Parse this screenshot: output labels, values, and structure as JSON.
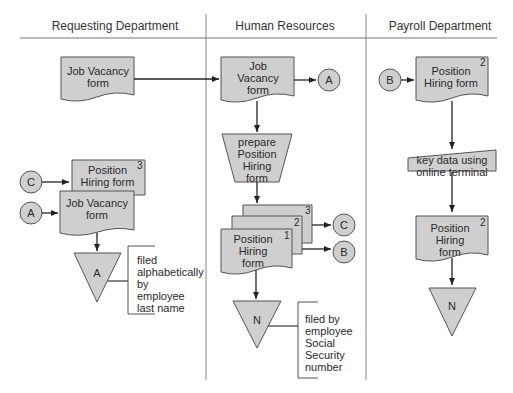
{
  "colors": {
    "fill": "#cfcfcf",
    "stroke": "#555555",
    "line": "#222222"
  },
  "lanes": [
    {
      "title": "Requesting Department"
    },
    {
      "title": "Human Resources"
    },
    {
      "title": "Payroll Department"
    }
  ],
  "requesting": {
    "job_vacancy_doc": "Job Vacancy form",
    "connector_c": "C",
    "connector_a": "A",
    "position_hiring_doc": "Position Hiring form",
    "position_hiring_copy": "3",
    "job_vacancy_doc2": "Job Vacancy form",
    "file_label": "A",
    "file_note": "filed alphabetically by employee last name"
  },
  "hr": {
    "job_vacancy_doc": "Job Vacancy form",
    "connector_a": "A",
    "manual_op": "prepare Position Hiring form",
    "copy3": "3",
    "copy2": "2",
    "copy1": "1",
    "position_hiring_doc": "Position Hiring form",
    "connector_c": "C",
    "connector_b": "B",
    "file_label": "N",
    "file_note": "filed by employee Social Security number"
  },
  "payroll": {
    "connector_b": "B",
    "position_hiring_doc": "Position Hiring form",
    "position_hiring_copy": "2",
    "manual_input": "key data using online terminal",
    "position_hiring_doc2": "Position Hiring form",
    "position_hiring_copy2": "2",
    "file_label": "N"
  }
}
